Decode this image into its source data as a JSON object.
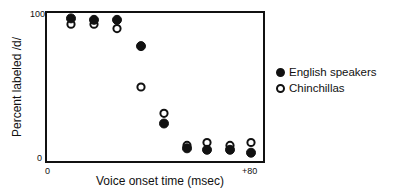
{
  "chart_data": {
    "type": "scatter",
    "title": "",
    "xlabel": "Voice onset time (msec)",
    "ylabel": "Percent labeled /d/",
    "x_tick_labels": [
      "0",
      "+80"
    ],
    "y_tick_labels": [
      "0",
      "100"
    ],
    "xlim": [
      0,
      90
    ],
    "ylim": [
      0,
      100
    ],
    "grid": false,
    "legend_position": "right",
    "x": [
      10,
      20,
      30,
      40,
      50,
      60,
      70,
      80,
      90
    ],
    "series": [
      {
        "name": "English speakers",
        "marker": "filled-circle",
        "values": [
          97,
          96,
          96,
          78,
          25,
          8,
          7,
          7,
          5
        ]
      },
      {
        "name": "Chinchillas",
        "marker": "open-circle",
        "values": [
          93,
          93,
          90,
          50,
          32,
          10,
          12,
          10,
          12
        ]
      }
    ]
  },
  "legend": {
    "items": [
      {
        "label": "English speakers",
        "style": "filled"
      },
      {
        "label": "Chinchillas",
        "style": "open"
      }
    ]
  },
  "axes": {
    "x_min_label": "0",
    "x_max_label": "+80",
    "y_min_label": "0",
    "y_max_label": "100",
    "xlabel": "Voice onset time (msec)",
    "ylabel": "Percent labeled /d/"
  },
  "colors": {
    "ink": "#111111",
    "background": "#ffffff"
  }
}
